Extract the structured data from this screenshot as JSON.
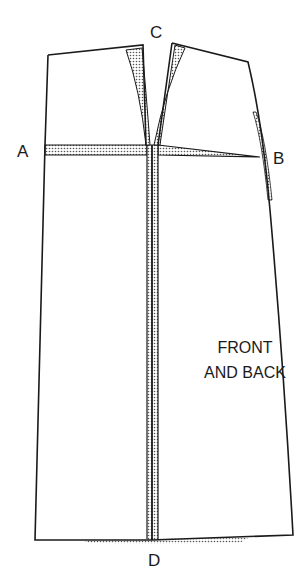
{
  "diagram": {
    "type": "sewing-pattern",
    "colors": {
      "line": "#1a1a1a",
      "background": "#ffffff",
      "dots": "#555555"
    },
    "points": [
      {
        "id": "A",
        "label": "A"
      },
      {
        "id": "B",
        "label": "B"
      },
      {
        "id": "C",
        "label": "C"
      },
      {
        "id": "D",
        "label": "D"
      }
    ],
    "piece_label": {
      "line1": "FRONT",
      "line2": "AND BACK"
    }
  }
}
